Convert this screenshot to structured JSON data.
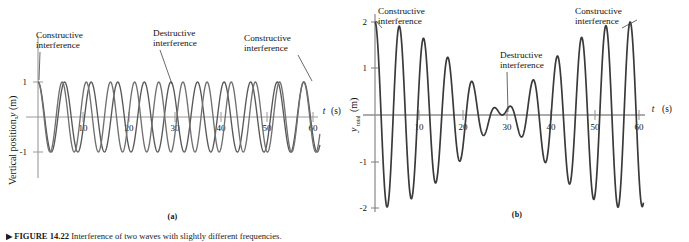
{
  "figure": {
    "caption_number": "FIGURE 14.22",
    "caption_text": "Interference of two waves with slightly different frequencies.",
    "caption_full": "▶ FIGURE 14.22 Interference of two waves with slightly different frequencies.",
    "arrow_glyph": "▶"
  },
  "panels": [
    {
      "id": "a",
      "sublabel": "(a)",
      "y_axis_label": "Vertical position, y (m)",
      "y_axis_label_parts": {
        "text": "Vertical position,",
        "symbol": "y",
        "unit": "(m)"
      },
      "x_axis_label": "t (s)",
      "x_axis_label_parts": {
        "symbol": "t",
        "unit": "(s)"
      },
      "x_ticks": [
        10,
        20,
        30,
        40,
        50,
        60
      ],
      "y_ticks": [
        1,
        -1
      ],
      "y_tick_labels": [
        "1",
        "-1"
      ],
      "xlim": [
        0,
        62
      ],
      "ylim": [
        -1.45,
        1.45
      ],
      "annotations": [
        {
          "label": "Constructive\ninterference",
          "line1": "Constructive",
          "line2": "interference",
          "t": 0
        },
        {
          "label": "Destructive\ninterference",
          "line1": "Destructive",
          "line2": "interference",
          "t": 29
        },
        {
          "label": "Constructive\ninterference",
          "line1": "Constructive",
          "line2": "interference",
          "t": 58
        }
      ],
      "colors": {
        "wave1": "#585858",
        "wave2": "#6f6f6f",
        "axis": "#9a9a9a",
        "text": "#111111"
      }
    },
    {
      "id": "b",
      "sublabel": "(b)",
      "y_axis_label": "y_total (m)",
      "y_axis_label_parts": {
        "symbol": "y",
        "subscript": "total",
        "unit": "(m)"
      },
      "x_axis_label": "t (s)",
      "x_axis_label_parts": {
        "symbol": "t",
        "unit": "(s)"
      },
      "x_ticks": [
        10,
        20,
        30,
        40,
        50,
        60
      ],
      "y_ticks": [
        2,
        1,
        -1,
        -2
      ],
      "y_tick_labels": [
        "2",
        "1",
        "-1",
        "-2"
      ],
      "xlim": [
        0,
        62
      ],
      "ylim": [
        -2.25,
        2.25
      ],
      "annotations": [
        {
          "label": "Constructive\ninterference",
          "line1": "Constructive",
          "line2": "interference",
          "t": 0
        },
        {
          "label": "Destructive\ninterference",
          "line1": "Destructive",
          "line2": "interference",
          "t": 29
        },
        {
          "label": "Constructive\ninterference",
          "line1": "Constructive",
          "line2": "interference",
          "t": 58
        }
      ],
      "colors": {
        "sum": "#3a3a3a",
        "axis": "#8f8f8f",
        "text": "#111111"
      }
    }
  ],
  "chart_data": [
    {
      "type": "line",
      "panel": "a",
      "title": "",
      "xlabel": "t (s)",
      "ylabel": "Vertical position, y (m)",
      "xlim": [
        0,
        62
      ],
      "ylim": [
        -1.45,
        1.45
      ],
      "xticks": [
        10,
        20,
        30,
        40,
        50,
        60
      ],
      "yticks": [
        1,
        -1
      ],
      "grid": false,
      "legend": "none",
      "series": [
        {
          "name": "wave 1",
          "form": "cosine",
          "amplitude": 1.0,
          "period_s": 5.8,
          "frequency_hz": 0.1724,
          "phase_deg": 0,
          "color": "#585858",
          "x": [
            0,
            1.45,
            2.9,
            4.35,
            5.8,
            7.25,
            8.7,
            10.15,
            11.6,
            13.05,
            14.5,
            15.95,
            17.4,
            18.85,
            20.3,
            21.75,
            23.2,
            24.65,
            26.1,
            27.55,
            29,
            30.45,
            31.9,
            33.35,
            34.8,
            36.25,
            37.7,
            39.15,
            40.6,
            42.05,
            43.5,
            44.95,
            46.4,
            47.85,
            49.3,
            50.75,
            52.2,
            53.65,
            55.1,
            56.55,
            58,
            59.45,
            60.9
          ],
          "y": [
            1,
            0,
            -1,
            0,
            1,
            0,
            -1,
            0,
            1,
            0,
            -1,
            0,
            1,
            0,
            -1,
            0,
            1,
            0,
            -1,
            0,
            1,
            0,
            -1,
            0,
            1,
            0,
            -1,
            0,
            1,
            0,
            -1,
            0,
            1,
            0,
            -1,
            0,
            1,
            0,
            -1,
            0,
            1,
            0,
            -1
          ]
        },
        {
          "name": "wave 2",
          "form": "cosine",
          "amplitude": 1.0,
          "period_s": 5.27,
          "frequency_hz": 0.1897,
          "phase_deg": 0,
          "color": "#6f6f6f",
          "x": [
            0,
            1.318,
            2.636,
            3.954,
            5.272,
            6.59,
            7.908,
            9.226,
            10.544,
            11.862,
            13.18,
            14.498,
            15.816,
            17.134,
            18.452,
            19.77,
            21.088,
            22.406,
            23.724,
            25.042,
            26.36,
            27.678,
            28.996,
            30.314,
            31.632,
            32.95,
            34.268,
            35.586,
            36.904,
            38.222,
            39.54,
            40.858,
            42.176,
            43.494,
            44.812,
            46.13,
            47.448,
            48.766,
            50.084,
            51.402,
            52.72,
            54.038,
            55.356,
            56.674,
            57.992,
            59.31,
            60.628
          ],
          "y": [
            1,
            0,
            -1,
            0,
            1,
            0,
            -1,
            0,
            1,
            0,
            -1,
            0,
            1,
            0,
            -1,
            0,
            1,
            0,
            -1,
            0,
            1,
            0,
            -1,
            0,
            1,
            0,
            -1,
            0,
            1,
            0,
            -1,
            0,
            1,
            0,
            -1,
            0,
            1,
            0,
            -1,
            0,
            1,
            0,
            -1,
            0,
            1,
            0,
            -1
          ]
        }
      ],
      "annotations": [
        {
          "text": "Constructive interference",
          "at_t": 0,
          "at_y": 1
        },
        {
          "text": "Destructive interference",
          "at_t": 29,
          "at_y": 1
        },
        {
          "text": "Constructive interference",
          "at_t": 58,
          "at_y": 1
        }
      ]
    },
    {
      "type": "line",
      "panel": "b",
      "title": "",
      "xlabel": "t (s)",
      "ylabel": "y_total (m)",
      "xlim": [
        0,
        62
      ],
      "ylim": [
        -2.25,
        2.25
      ],
      "xticks": [
        10,
        20,
        30,
        40,
        50,
        60
      ],
      "yticks": [
        2,
        1,
        -1,
        -2
      ],
      "grid": false,
      "legend": "none",
      "series": [
        {
          "name": "y_total = wave1 + wave2",
          "form": "beat",
          "max_amplitude": 2.0,
          "beat_period_s": 58,
          "color": "#3a3a3a",
          "envelope_peaks_t": [
            0,
            58
          ],
          "envelope_node_t": [
            29
          ],
          "key_points": [
            {
              "t": 0,
              "y": 2.0
            },
            {
              "t": 4.8,
              "y": -1.88
            },
            {
              "t": 10.1,
              "y": 1.68
            },
            {
              "t": 15.2,
              "y": -1.3
            },
            {
              "t": 21.0,
              "y": 0.85
            },
            {
              "t": 26.3,
              "y": -0.45
            },
            {
              "t": 29.0,
              "y": 0.05
            },
            {
              "t": 33.5,
              "y": -0.45
            },
            {
              "t": 38.8,
              "y": 0.85
            },
            {
              "t": 44.0,
              "y": -1.3
            },
            {
              "t": 49.5,
              "y": 1.68
            },
            {
              "t": 55.0,
              "y": -1.88
            },
            {
              "t": 58.0,
              "y": 2.0
            }
          ]
        }
      ],
      "annotations": [
        {
          "text": "Constructive interference",
          "at_t": 0,
          "at_y": 2
        },
        {
          "text": "Destructive interference",
          "at_t": 29,
          "at_y": 0
        },
        {
          "text": "Constructive interference",
          "at_t": 58,
          "at_y": 2
        }
      ]
    }
  ]
}
